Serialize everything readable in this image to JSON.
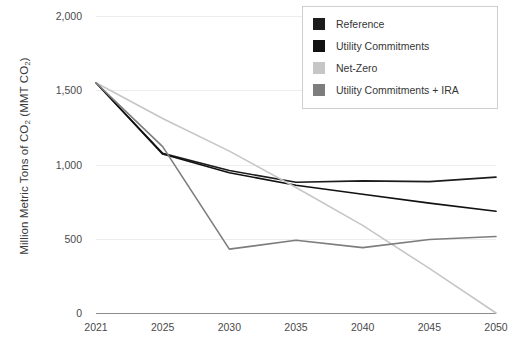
{
  "chart_data": {
    "type": "line",
    "title": "",
    "xlabel": "",
    "ylabel": "Million Metric Tons of CO₂ (MMT CO₂)",
    "categories": [
      "2021",
      "2025",
      "2030",
      "2035",
      "2040",
      "2045",
      "2050"
    ],
    "ylim": [
      0,
      2000
    ],
    "yticks": [
      "0",
      "500",
      "1,000",
      "1,500",
      "2,000"
    ],
    "ytick_values": [
      0,
      500,
      1000,
      1500,
      2000
    ],
    "grid": true,
    "legend_position": "top-right",
    "series": [
      {
        "name": "Reference",
        "color": "#1c1c1c",
        "values": [
          1550,
          1075,
          960,
          880,
          890,
          885,
          915
        ]
      },
      {
        "name": "Utility Commitments",
        "color": "#111111",
        "values": [
          1550,
          1070,
          945,
          860,
          800,
          740,
          685
        ]
      },
      {
        "name": "Net-Zero",
        "color": "#c6c6c6",
        "values": [
          1550,
          1310,
          1090,
          845,
          590,
          300,
          0
        ]
      },
      {
        "name": "Utility Commitments + IRA",
        "color": "#7d7d7d",
        "values": [
          1550,
          1120,
          430,
          490,
          440,
          495,
          515
        ]
      }
    ]
  },
  "axes": {
    "y_title": "Million Metric Tons of CO",
    "y_title_sub": "2",
    "y_title_tail": " (MMT CO",
    "y_title_sub2": "2",
    "y_title_close": ")"
  }
}
